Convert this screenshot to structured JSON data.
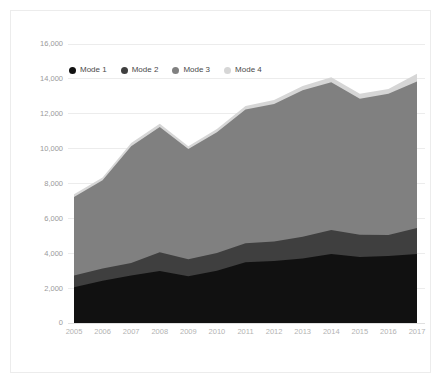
{
  "chart_data": {
    "type": "area",
    "stacked": true,
    "title": "",
    "subtitle": "",
    "xlabel": "",
    "ylabel": "",
    "categories": [
      "2005",
      "2006",
      "2007",
      "2008",
      "2009",
      "2010",
      "2011",
      "2012",
      "2013",
      "2014",
      "2015",
      "2016",
      "2017"
    ],
    "x_tick_labels": [
      "2005",
      "2006",
      "2007",
      "2008",
      "2009",
      "2010",
      "2011",
      "2012",
      "2013",
      "2014",
      "2015",
      "2016",
      "2017"
    ],
    "y_tick_labels": [
      "0",
      "2,000",
      "4,000",
      "6,000",
      "8,000",
      "10,000",
      "12,000",
      "14,000",
      "16,000"
    ],
    "y_tick_values": [
      0,
      2000,
      4000,
      6000,
      8000,
      10000,
      12000,
      14000,
      16000
    ],
    "ylim": [
      0,
      16000
    ],
    "grid": true,
    "grid_axis": "y",
    "legend_position": "top-left-inside",
    "series": [
      {
        "name": "Mode 1",
        "color": "#111111",
        "values": [
          2050,
          2420,
          2720,
          2980,
          2680,
          3000,
          3480,
          3560,
          3700,
          3950,
          3780,
          3840,
          3950
        ]
      },
      {
        "name": "Mode 2",
        "color": "#3f3f3f",
        "values": [
          680,
          700,
          720,
          1080,
          980,
          1020,
          1100,
          1120,
          1250,
          1380,
          1280,
          1200,
          1500
        ]
      },
      {
        "name": "Mode 3",
        "color": "#808080",
        "values": [
          4500,
          5060,
          6700,
          7180,
          6320,
          6920,
          7660,
          7880,
          8400,
          8480,
          7800,
          8100,
          8400
        ]
      },
      {
        "name": "Mode 4",
        "color": "#d6d6d6",
        "values": [
          150,
          170,
          180,
          180,
          160,
          180,
          200,
          230,
          240,
          290,
          280,
          280,
          450
        ]
      }
    ],
    "totals": [
      7380,
      8350,
      10320,
      11420,
      10140,
      11120,
      12440,
      12790,
      13590,
      14100,
      13140,
      13420,
      14300
    ]
  },
  "legend": {
    "items": [
      {
        "label": "Mode 1",
        "color": "#111111"
      },
      {
        "label": "Mode 2",
        "color": "#3f3f3f"
      },
      {
        "label": "Mode 3",
        "color": "#808080"
      },
      {
        "label": "Mode 4",
        "color": "#d6d6d6"
      }
    ]
  },
  "style": {
    "background": "#ffffff",
    "border_color": "#ececec",
    "gridline_color": "#ececec",
    "ytick_color": "#9a9a9a",
    "xtick_color": "#b3b3b3"
  }
}
